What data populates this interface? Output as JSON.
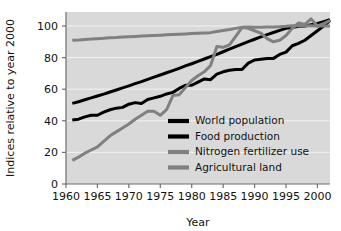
{
  "chart_data": {
    "type": "line",
    "title": "",
    "xlabel": "Year",
    "ylabel": "Indices relative to year 2000",
    "xlim": [
      1960,
      2002
    ],
    "ylim": [
      0,
      108
    ],
    "xticks": [
      1960,
      1965,
      1970,
      1975,
      1980,
      1985,
      1990,
      1995,
      2000
    ],
    "yticks": [
      0,
      20,
      40,
      60,
      80,
      100
    ],
    "xtick_labels": [
      "1960",
      "1965",
      "1970",
      "1975",
      "1980",
      "1985",
      "1990",
      "1995",
      "2000"
    ],
    "ytick_labels": [
      "0",
      "20",
      "40",
      "60",
      "80",
      "100"
    ],
    "grid": true,
    "grid_axis": "y",
    "legend_position": "center",
    "plot_background": "#d9d9d9",
    "figure_background": "#ffffff",
    "x": [
      1961,
      1962,
      1963,
      1964,
      1965,
      1966,
      1967,
      1968,
      1969,
      1970,
      1971,
      1972,
      1973,
      1974,
      1975,
      1976,
      1977,
      1978,
      1979,
      1980,
      1981,
      1982,
      1983,
      1984,
      1985,
      1986,
      1987,
      1988,
      1989,
      1990,
      1991,
      1992,
      1993,
      1994,
      1995,
      1996,
      1997,
      1998,
      1999,
      2000,
      2001,
      2002
    ],
    "series": [
      {
        "name": "World population",
        "color": "#000000",
        "width": 3.0,
        "values": [
          51.0,
          52.1,
          53.3,
          54.5,
          55.7,
          56.9,
          58.2,
          59.5,
          60.8,
          62.1,
          63.5,
          64.8,
          66.2,
          67.6,
          69.0,
          70.4,
          71.8,
          73.2,
          74.7,
          76.1,
          77.6,
          79.1,
          80.6,
          82.1,
          83.7,
          85.3,
          86.9,
          88.5,
          90.1,
          91.6,
          93.1,
          94.5,
          95.9,
          97.2,
          98.5,
          99.1,
          99.8,
          100.0,
          100.8,
          101.6,
          102.8,
          104.0
        ]
      },
      {
        "name": "Food production",
        "color": "#000000",
        "width": 3.0,
        "values": [
          40.5,
          41.0,
          42.5,
          43.5,
          43.5,
          45.5,
          47.0,
          48.0,
          48.5,
          50.5,
          51.5,
          51.0,
          53.5,
          54.5,
          55.5,
          57.0,
          58.0,
          60.5,
          62.5,
          62.5,
          64.5,
          66.5,
          66.0,
          69.5,
          71.0,
          72.0,
          72.5,
          72.5,
          76.5,
          78.5,
          79.0,
          79.5,
          79.5,
          82.0,
          83.5,
          87.5,
          89.0,
          91.0,
          94.0,
          97.0,
          100.0,
          103.5
        ]
      },
      {
        "name": "Nitrogen fertilizer use",
        "color": "#808080",
        "width": 3.0,
        "values": [
          15.0,
          17.0,
          19.5,
          21.5,
          23.5,
          27.0,
          30.5,
          33.0,
          35.5,
          38.0,
          41.0,
          43.5,
          46.0,
          46.0,
          43.5,
          47.0,
          56.0,
          56.5,
          61.0,
          65.5,
          68.5,
          71.0,
          75.0,
          87.0,
          86.5,
          88.0,
          93.5,
          99.0,
          98.5,
          97.0,
          95.5,
          92.0,
          90.0,
          91.0,
          94.0,
          98.5,
          102.0,
          101.0,
          104.5,
          100.0,
          101.5,
          103.5
        ]
      },
      {
        "name": "Agricultural land",
        "color": "#808080",
        "width": 3.0,
        "values": [
          91.0,
          91.2,
          91.5,
          91.7,
          92.0,
          92.2,
          92.5,
          92.7,
          93.0,
          93.2,
          93.4,
          93.6,
          93.8,
          94.0,
          94.2,
          94.4,
          94.6,
          94.8,
          95.0,
          95.2,
          95.4,
          95.6,
          95.8,
          96.5,
          97.2,
          97.8,
          98.5,
          99.2,
          99.4,
          99.2,
          99.2,
          99.3,
          99.4,
          99.6,
          99.8,
          100.2,
          100.2,
          100.2,
          100.2,
          100.0,
          100.0,
          100.0
        ]
      }
    ],
    "legend_entries": [
      {
        "label": "World population",
        "color": "#000000"
      },
      {
        "label": "Food production",
        "color": "#000000"
      },
      {
        "label": "Nitrogen fertilizer use",
        "color": "#808080"
      },
      {
        "label": "Agricultural land",
        "color": "#808080"
      }
    ]
  }
}
